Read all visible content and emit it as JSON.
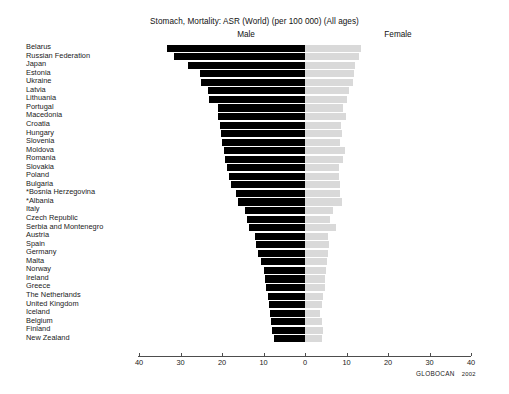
{
  "chart_data": {
    "type": "bar",
    "title": "Stomach, Mortality: ASR (World) (per 100 000) (All ages)",
    "orientation": "horizontal-diverging",
    "xlabel": "",
    "ylabel": "",
    "xlim": [
      -40,
      40
    ],
    "xticks": [
      40,
      30,
      20,
      10,
      0,
      10,
      20,
      30,
      40
    ],
    "grid": false,
    "legend_position": "top",
    "categories": [
      "Belarus",
      "Russian Federation",
      "Japan",
      "Estonia",
      "Ukraine",
      "Latvia",
      "Lithuania",
      "Portugal",
      "Macedonia",
      "Croatia",
      "Hungary",
      "Slovenia",
      "Moldova",
      "Romania",
      "Slovakia",
      "Poland",
      "Bulgaria",
      "*Bosnia Herzegovina",
      "*Albania",
      "Italy",
      "Czech Republic",
      "Serbia and Montenegro",
      "Austria",
      "Spain",
      "Germany",
      "Malta",
      "Norway",
      "Ireland",
      "Greece",
      "The Netherlands",
      "United Kingdom",
      "Iceland",
      "Belgium",
      "Finland",
      "New Zealand"
    ],
    "series": [
      {
        "name": "Male",
        "direction": "left",
        "color": "#000000",
        "values": [
          33.2,
          31.5,
          28.3,
          25.4,
          25.0,
          23.4,
          23.2,
          21.0,
          20.9,
          20.6,
          20.3,
          19.9,
          19.4,
          19.2,
          18.7,
          18.3,
          17.8,
          16.7,
          16.1,
          14.5,
          13.9,
          13.5,
          12.0,
          11.7,
          11.4,
          10.5,
          10.0,
          9.6,
          9.4,
          8.9,
          8.7,
          8.4,
          8.2,
          7.9,
          7.4
        ]
      },
      {
        "name": "Female",
        "direction": "right",
        "color": "#d9d9d9",
        "values": [
          13.4,
          13.0,
          12.1,
          11.7,
          11.5,
          10.6,
          10.2,
          9.2,
          9.9,
          8.6,
          9.0,
          8.4,
          9.6,
          9.1,
          8.2,
          8.2,
          8.4,
          8.5,
          8.8,
          6.7,
          6.0,
          7.4,
          5.5,
          5.7,
          5.5,
          5.3,
          5.0,
          4.7,
          4.8,
          4.3,
          4.2,
          3.7,
          4.0,
          4.4,
          4.2
        ]
      }
    ],
    "source": "GLOBOCAN",
    "source_year": "2002"
  },
  "labels": {
    "male": "Male",
    "female": "Female"
  }
}
